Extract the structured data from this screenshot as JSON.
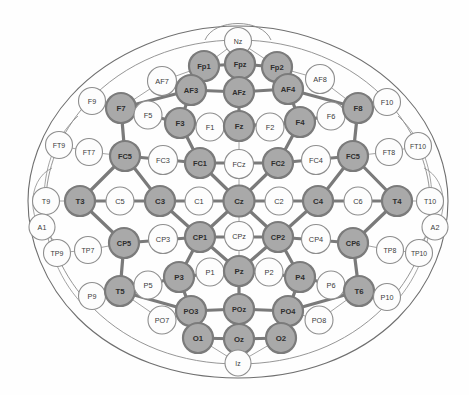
{
  "diagram": {
    "colors": {
      "selected_fill": "#a9a9a9",
      "selected_stroke": "#7b7b7b",
      "unselected_fill": "#fdfdfd",
      "unselected_stroke": "#8e8e8e",
      "link": "#7a7a7a",
      "outline": "#6f6f6f",
      "background": "#ffffff"
    },
    "legend": {
      "selected_meaning": "selected electrode",
      "unselected_meaning": "unselected electrode"
    }
  },
  "electrodes": [
    {
      "id": "Nz",
      "label": "Nz",
      "x": 238,
      "y": 41,
      "r": 13.5,
      "fs": 7.0,
      "selected": false
    },
    {
      "id": "Fp1",
      "label": "Fp1",
      "x": 204,
      "y": 66,
      "r": 15.0,
      "fs": 7.6,
      "selected": true
    },
    {
      "id": "Fpz",
      "label": "Fpz",
      "x": 240,
      "y": 64,
      "r": 15.0,
      "fs": 7.4,
      "selected": true
    },
    {
      "id": "Fp2",
      "label": "Fp2",
      "x": 277,
      "y": 67,
      "r": 15.0,
      "fs": 7.6,
      "selected": true
    },
    {
      "id": "AF7",
      "label": "AF7",
      "x": 162,
      "y": 81,
      "r": 14.5,
      "fs": 7.4,
      "selected": false
    },
    {
      "id": "AF3",
      "label": "AF3",
      "x": 191,
      "y": 90,
      "r": 15.0,
      "fs": 7.6,
      "selected": true
    },
    {
      "id": "AFz",
      "label": "AFz",
      "x": 239,
      "y": 92,
      "r": 15.0,
      "fs": 7.4,
      "selected": true
    },
    {
      "id": "AF4",
      "label": "AF4",
      "x": 288,
      "y": 89,
      "r": 15.0,
      "fs": 7.6,
      "selected": true
    },
    {
      "id": "AF8",
      "label": "AF8",
      "x": 320,
      "y": 79,
      "r": 14.5,
      "fs": 7.4,
      "selected": false
    },
    {
      "id": "F9",
      "label": "F9",
      "x": 92,
      "y": 101,
      "r": 13.5,
      "fs": 7.2,
      "selected": false
    },
    {
      "id": "F7",
      "label": "F7",
      "x": 121,
      "y": 108,
      "r": 15.0,
      "fs": 7.8,
      "selected": true
    },
    {
      "id": "F5",
      "label": "F5",
      "x": 148,
      "y": 115,
      "r": 14.0,
      "fs": 7.4,
      "selected": false
    },
    {
      "id": "F3",
      "label": "F3",
      "x": 180,
      "y": 123,
      "r": 15.0,
      "fs": 7.8,
      "selected": true
    },
    {
      "id": "F1",
      "label": "F1",
      "x": 210,
      "y": 127,
      "r": 14.0,
      "fs": 7.4,
      "selected": false
    },
    {
      "id": "Fz",
      "label": "Fz",
      "x": 239,
      "y": 126,
      "r": 15.0,
      "fs": 7.8,
      "selected": true
    },
    {
      "id": "F2",
      "label": "F2",
      "x": 270,
      "y": 127,
      "r": 14.0,
      "fs": 7.4,
      "selected": false
    },
    {
      "id": "F4",
      "label": "F4",
      "x": 300,
      "y": 122,
      "r": 15.0,
      "fs": 7.8,
      "selected": true
    },
    {
      "id": "F6",
      "label": "F6",
      "x": 331,
      "y": 116,
      "r": 14.0,
      "fs": 7.4,
      "selected": false
    },
    {
      "id": "F8",
      "label": "F8",
      "x": 358,
      "y": 108,
      "r": 15.0,
      "fs": 7.8,
      "selected": true
    },
    {
      "id": "F10",
      "label": "F10",
      "x": 387,
      "y": 102,
      "r": 13.5,
      "fs": 7.2,
      "selected": false
    },
    {
      "id": "FT9",
      "label": "FT9",
      "x": 59,
      "y": 145,
      "r": 13.5,
      "fs": 7.0,
      "selected": false
    },
    {
      "id": "FT7",
      "label": "FT7",
      "x": 89,
      "y": 152,
      "r": 13.5,
      "fs": 7.0,
      "selected": false
    },
    {
      "id": "FC5",
      "label": "FC5",
      "x": 125,
      "y": 156,
      "r": 15.0,
      "fs": 7.4,
      "selected": true
    },
    {
      "id": "FC3",
      "label": "FC3",
      "x": 163,
      "y": 160,
      "r": 14.5,
      "fs": 7.4,
      "selected": false
    },
    {
      "id": "FC1",
      "label": "FC1",
      "x": 200,
      "y": 163,
      "r": 15.0,
      "fs": 7.4,
      "selected": true
    },
    {
      "id": "FCz",
      "label": "FCz",
      "x": 239,
      "y": 164,
      "r": 14.5,
      "fs": 7.2,
      "selected": false
    },
    {
      "id": "FC2",
      "label": "FC2",
      "x": 278,
      "y": 163,
      "r": 15.0,
      "fs": 7.4,
      "selected": true
    },
    {
      "id": "FC4",
      "label": "FC4",
      "x": 316,
      "y": 160,
      "r": 14.5,
      "fs": 7.4,
      "selected": false
    },
    {
      "id": "FC6",
      "label": "FC5",
      "x": 353,
      "y": 156,
      "r": 15.0,
      "fs": 7.4,
      "selected": true
    },
    {
      "id": "FT8",
      "label": "FT8",
      "x": 389,
      "y": 152,
      "r": 13.5,
      "fs": 7.0,
      "selected": false
    },
    {
      "id": "FT10",
      "label": "FT10",
      "x": 418,
      "y": 146,
      "r": 13.5,
      "fs": 6.8,
      "selected": false
    },
    {
      "id": "T9",
      "label": "T9",
      "x": 46,
      "y": 201,
      "r": 13.5,
      "fs": 7.2,
      "selected": false
    },
    {
      "id": "T3",
      "label": "T3",
      "x": 80,
      "y": 201,
      "r": 15.0,
      "fs": 7.8,
      "selected": true
    },
    {
      "id": "C5",
      "label": "C5",
      "x": 120,
      "y": 201,
      "r": 14.0,
      "fs": 7.4,
      "selected": false
    },
    {
      "id": "C3",
      "label": "C3",
      "x": 160,
      "y": 201,
      "r": 15.0,
      "fs": 7.8,
      "selected": true
    },
    {
      "id": "C1",
      "label": "C1",
      "x": 199,
      "y": 201,
      "r": 14.0,
      "fs": 7.4,
      "selected": false
    },
    {
      "id": "Cz",
      "label": "Cz",
      "x": 239,
      "y": 201,
      "r": 15.5,
      "fs": 7.8,
      "selected": true
    },
    {
      "id": "C2",
      "label": "C2",
      "x": 279,
      "y": 201,
      "r": 14.0,
      "fs": 7.4,
      "selected": false
    },
    {
      "id": "C4",
      "label": "C4",
      "x": 318,
      "y": 201,
      "r": 15.0,
      "fs": 7.8,
      "selected": true
    },
    {
      "id": "C6",
      "label": "C6",
      "x": 358,
      "y": 201,
      "r": 14.0,
      "fs": 7.4,
      "selected": false
    },
    {
      "id": "T4",
      "label": "T4",
      "x": 397,
      "y": 201,
      "r": 15.0,
      "fs": 7.8,
      "selected": true
    },
    {
      "id": "T10",
      "label": "T10",
      "x": 430,
      "y": 201,
      "r": 13.5,
      "fs": 7.0,
      "selected": false
    },
    {
      "id": "A1",
      "label": "A1",
      "x": 42,
      "y": 227,
      "r": 13.0,
      "fs": 7.2,
      "selected": false
    },
    {
      "id": "A2",
      "label": "A2",
      "x": 435,
      "y": 227,
      "r": 13.0,
      "fs": 7.2,
      "selected": false
    },
    {
      "id": "TP9",
      "label": "TP9",
      "x": 57,
      "y": 253,
      "r": 13.5,
      "fs": 7.0,
      "selected": false
    },
    {
      "id": "TP7",
      "label": "TP7",
      "x": 88,
      "y": 250,
      "r": 13.5,
      "fs": 7.0,
      "selected": false
    },
    {
      "id": "CP5",
      "label": "CP5",
      "x": 124,
      "y": 243,
      "r": 15.0,
      "fs": 7.4,
      "selected": true
    },
    {
      "id": "CP3",
      "label": "CP3",
      "x": 163,
      "y": 239,
      "r": 14.5,
      "fs": 7.4,
      "selected": false
    },
    {
      "id": "CP1",
      "label": "CP1",
      "x": 200,
      "y": 237,
      "r": 15.0,
      "fs": 7.4,
      "selected": true
    },
    {
      "id": "CPz",
      "label": "CPz",
      "x": 239,
      "y": 236,
      "r": 14.5,
      "fs": 7.2,
      "selected": false
    },
    {
      "id": "CP2",
      "label": "CP2",
      "x": 278,
      "y": 237,
      "r": 15.0,
      "fs": 7.4,
      "selected": true
    },
    {
      "id": "CP4",
      "label": "CP4",
      "x": 316,
      "y": 239,
      "r": 14.5,
      "fs": 7.4,
      "selected": false
    },
    {
      "id": "CP6",
      "label": "CP6",
      "x": 353,
      "y": 243,
      "r": 15.0,
      "fs": 7.4,
      "selected": true
    },
    {
      "id": "TP8",
      "label": "TP8",
      "x": 390,
      "y": 250,
      "r": 13.5,
      "fs": 7.0,
      "selected": false
    },
    {
      "id": "TP10",
      "label": "TP10",
      "x": 419,
      "y": 253,
      "r": 13.5,
      "fs": 6.8,
      "selected": false
    },
    {
      "id": "P9",
      "label": "P9",
      "x": 92,
      "y": 296,
      "r": 13.5,
      "fs": 7.2,
      "selected": false
    },
    {
      "id": "T5",
      "label": "T5",
      "x": 120,
      "y": 291,
      "r": 15.0,
      "fs": 7.8,
      "selected": true
    },
    {
      "id": "P5",
      "label": "P5",
      "x": 148,
      "y": 285,
      "r": 14.0,
      "fs": 7.4,
      "selected": false
    },
    {
      "id": "P3",
      "label": "P3",
      "x": 179,
      "y": 277,
      "r": 15.0,
      "fs": 7.8,
      "selected": true
    },
    {
      "id": "P1",
      "label": "P1",
      "x": 210,
      "y": 272,
      "r": 14.0,
      "fs": 7.4,
      "selected": false
    },
    {
      "id": "Pz",
      "label": "Pz",
      "x": 239,
      "y": 271,
      "r": 15.0,
      "fs": 7.8,
      "selected": true
    },
    {
      "id": "P2",
      "label": "P2",
      "x": 269,
      "y": 272,
      "r": 14.0,
      "fs": 7.4,
      "selected": false
    },
    {
      "id": "P4",
      "label": "P4",
      "x": 300,
      "y": 277,
      "r": 15.0,
      "fs": 7.8,
      "selected": true
    },
    {
      "id": "P6",
      "label": "P6",
      "x": 331,
      "y": 285,
      "r": 14.0,
      "fs": 7.4,
      "selected": false
    },
    {
      "id": "T6",
      "label": "T6",
      "x": 359,
      "y": 291,
      "r": 15.0,
      "fs": 7.8,
      "selected": true
    },
    {
      "id": "P10",
      "label": "P10",
      "x": 387,
      "y": 297,
      "r": 13.5,
      "fs": 7.2,
      "selected": false
    },
    {
      "id": "PO7",
      "label": "PO7",
      "x": 162,
      "y": 320,
      "r": 14.0,
      "fs": 7.2,
      "selected": false
    },
    {
      "id": "PO3",
      "label": "PO3",
      "x": 191,
      "y": 311,
      "r": 15.0,
      "fs": 7.4,
      "selected": true
    },
    {
      "id": "POz",
      "label": "POz",
      "x": 239,
      "y": 309,
      "r": 15.0,
      "fs": 7.2,
      "selected": true
    },
    {
      "id": "PO4",
      "label": "PO4",
      "x": 288,
      "y": 311,
      "r": 15.0,
      "fs": 7.4,
      "selected": true
    },
    {
      "id": "PO8",
      "label": "PO8",
      "x": 319,
      "y": 320,
      "r": 14.0,
      "fs": 7.2,
      "selected": false
    },
    {
      "id": "O1",
      "label": "O1",
      "x": 198,
      "y": 338,
      "r": 15.0,
      "fs": 7.8,
      "selected": true
    },
    {
      "id": "Oz",
      "label": "Oz",
      "x": 239,
      "y": 339,
      "r": 15.0,
      "fs": 7.8,
      "selected": true
    },
    {
      "id": "O2",
      "label": "O2",
      "x": 281,
      "y": 338,
      "r": 15.0,
      "fs": 7.8,
      "selected": true
    },
    {
      "id": "Iz",
      "label": "Iz",
      "x": 238,
      "y": 363,
      "r": 13.0,
      "fs": 6.8,
      "selected": false
    }
  ],
  "links": [
    [
      "Fp1",
      "Fpz"
    ],
    [
      "Fpz",
      "Fp2"
    ],
    [
      "Fp1",
      "AF3"
    ],
    [
      "Fp2",
      "AF4"
    ],
    [
      "Fpz",
      "AFz"
    ],
    [
      "AF3",
      "AFz"
    ],
    [
      "AFz",
      "AF4"
    ],
    [
      "AF3",
      "F7"
    ],
    [
      "AF4",
      "F8"
    ],
    [
      "AF3",
      "F3"
    ],
    [
      "AF4",
      "F4"
    ],
    [
      "AFz",
      "Fz"
    ],
    [
      "F7",
      "F3"
    ],
    [
      "F3",
      "Fz"
    ],
    [
      "Fz",
      "F4"
    ],
    [
      "F4",
      "F8"
    ],
    [
      "F7",
      "FC5"
    ],
    [
      "F8",
      "FC6"
    ],
    [
      "F3",
      "FC1"
    ],
    [
      "F4",
      "FC2"
    ],
    [
      "FC5",
      "FC1"
    ],
    [
      "FC1",
      "FC2"
    ],
    [
      "FC2",
      "FC6"
    ],
    [
      "FC5",
      "T3"
    ],
    [
      "FC6",
      "T4"
    ],
    [
      "FC1",
      "Cz"
    ],
    [
      "FC2",
      "Cz"
    ],
    [
      "FC5",
      "C3"
    ],
    [
      "FC6",
      "C4"
    ],
    [
      "T3",
      "C3"
    ],
    [
      "C3",
      "Cz"
    ],
    [
      "Cz",
      "C4"
    ],
    [
      "C4",
      "T4"
    ],
    [
      "T3",
      "CP5"
    ],
    [
      "T4",
      "CP6"
    ],
    [
      "C3",
      "CP1"
    ],
    [
      "C4",
      "CP2"
    ],
    [
      "Cz",
      "CP1"
    ],
    [
      "Cz",
      "CP2"
    ],
    [
      "CP5",
      "CP1"
    ],
    [
      "CP1",
      "CP2"
    ],
    [
      "CP2",
      "CP6"
    ],
    [
      "CP5",
      "T5"
    ],
    [
      "CP6",
      "T6"
    ],
    [
      "CP1",
      "P3"
    ],
    [
      "CP2",
      "P4"
    ],
    [
      "CP1",
      "Pz"
    ],
    [
      "CP2",
      "Pz"
    ],
    [
      "T5",
      "P3"
    ],
    [
      "P3",
      "Pz"
    ],
    [
      "Pz",
      "P4"
    ],
    [
      "P4",
      "T6"
    ],
    [
      "T5",
      "PO3"
    ],
    [
      "T6",
      "PO4"
    ],
    [
      "P3",
      "PO3"
    ],
    [
      "P4",
      "PO4"
    ],
    [
      "Pz",
      "POz"
    ],
    [
      "PO3",
      "POz"
    ],
    [
      "POz",
      "PO4"
    ],
    [
      "PO3",
      "O1"
    ],
    [
      "PO4",
      "O2"
    ],
    [
      "POz",
      "Oz"
    ],
    [
      "O1",
      "Oz"
    ],
    [
      "Oz",
      "O2"
    ]
  ],
  "thin_links": [
    [
      "Nz",
      "Fp1"
    ],
    [
      "Nz",
      "Fpz"
    ],
    [
      "Nz",
      "Fp2"
    ],
    [
      "AF7",
      "Fp1"
    ],
    [
      "AF8",
      "Fp2"
    ],
    [
      "AF7",
      "F7"
    ],
    [
      "AF8",
      "F8"
    ],
    [
      "F9",
      "F7"
    ],
    [
      "F10",
      "F8"
    ],
    [
      "F5",
      "F7"
    ],
    [
      "F5",
      "F3"
    ],
    [
      "F6",
      "F8"
    ],
    [
      "F6",
      "F4"
    ],
    [
      "F1",
      "Fz"
    ],
    [
      "F1",
      "F3"
    ],
    [
      "F2",
      "Fz"
    ],
    [
      "F2",
      "F4"
    ],
    [
      "FT9",
      "FT7"
    ],
    [
      "FT7",
      "FC5"
    ],
    [
      "FT8",
      "FC6"
    ],
    [
      "FT8",
      "FT10"
    ],
    [
      "FC3",
      "FC5"
    ],
    [
      "FC3",
      "FC1"
    ],
    [
      "FC4",
      "FC2"
    ],
    [
      "FC4",
      "FC6"
    ],
    [
      "FCz",
      "Fz"
    ],
    [
      "FCz",
      "Cz"
    ],
    [
      "T9",
      "T3"
    ],
    [
      "T10",
      "T4"
    ],
    [
      "C5",
      "T3"
    ],
    [
      "C5",
      "C3"
    ],
    [
      "C6",
      "C4"
    ],
    [
      "C6",
      "T4"
    ],
    [
      "C1",
      "C3"
    ],
    [
      "C1",
      "Cz"
    ],
    [
      "C2",
      "Cz"
    ],
    [
      "C2",
      "C4"
    ],
    [
      "A1",
      "T9"
    ],
    [
      "A2",
      "T10"
    ],
    [
      "TP9",
      "TP7"
    ],
    [
      "TP7",
      "CP5"
    ],
    [
      "TP8",
      "CP6"
    ],
    [
      "TP8",
      "TP10"
    ],
    [
      "CP3",
      "CP5"
    ],
    [
      "CP3",
      "CP1"
    ],
    [
      "CP4",
      "CP2"
    ],
    [
      "CP4",
      "CP6"
    ],
    [
      "CPz",
      "Cz"
    ],
    [
      "CPz",
      "Pz"
    ],
    [
      "P9",
      "T5"
    ],
    [
      "P10",
      "T6"
    ],
    [
      "P5",
      "T5"
    ],
    [
      "P5",
      "P3"
    ],
    [
      "P6",
      "P4"
    ],
    [
      "P6",
      "T6"
    ],
    [
      "P1",
      "P3"
    ],
    [
      "P1",
      "Pz"
    ],
    [
      "P2",
      "Pz"
    ],
    [
      "P2",
      "P4"
    ],
    [
      "PO7",
      "T5"
    ],
    [
      "PO7",
      "PO3"
    ],
    [
      "PO8",
      "PO4"
    ],
    [
      "PO8",
      "T6"
    ],
    [
      "Iz",
      "O1"
    ],
    [
      "Iz",
      "Oz"
    ],
    [
      "Iz",
      "O2"
    ]
  ]
}
